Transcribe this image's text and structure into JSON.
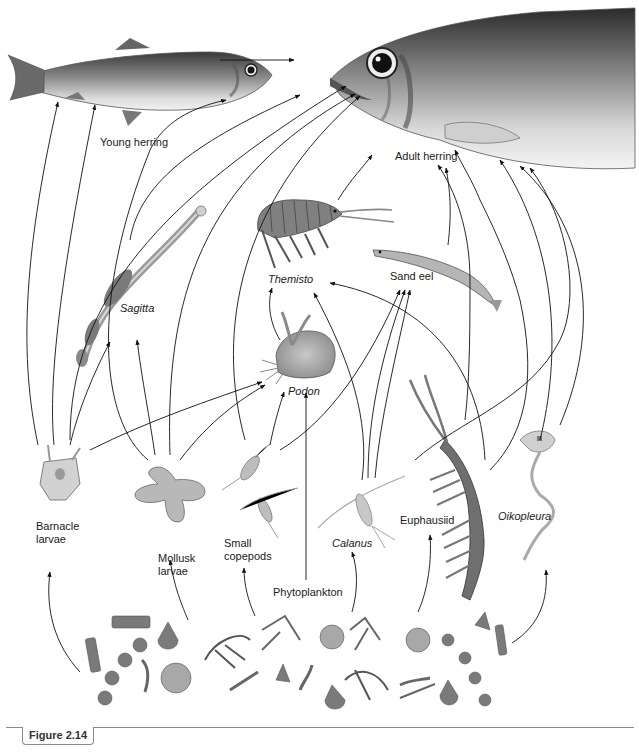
{
  "diagram": {
    "type": "food-web",
    "nodes": {
      "young_herring": {
        "label": "Young herring",
        "italic": false
      },
      "adult_herring": {
        "label": "Adult herring",
        "italic": false
      },
      "sagitta": {
        "label": "Sagitta",
        "italic": true
      },
      "themisto": {
        "label": "Themisto",
        "italic": true
      },
      "sand_eel": {
        "label": "Sand eel",
        "italic": false
      },
      "podon": {
        "label": "Podon",
        "italic": true
      },
      "barnacle_larvae": {
        "label": "Barnacle\nlarvae",
        "italic": false
      },
      "mollusk_larvae": {
        "label": "Mollusk\nlarvae",
        "italic": false
      },
      "small_copepods": {
        "label": "Small\ncopepods",
        "italic": false
      },
      "phytoplankton": {
        "label": "Phytoplankton",
        "italic": false
      },
      "calanus": {
        "label": "Calanus",
        "italic": true
      },
      "euphausiid": {
        "label": "Euphausiid",
        "italic": false
      },
      "oikopleura": {
        "label": "Oikopleura",
        "italic": true
      }
    },
    "edges": [
      [
        "young_herring",
        "adult_herring"
      ],
      [
        "phytoplankton",
        "barnacle_larvae"
      ],
      [
        "phytoplankton",
        "mollusk_larvae"
      ],
      [
        "phytoplankton",
        "small_copepods"
      ],
      [
        "phytoplankton",
        "calanus"
      ],
      [
        "phytoplankton",
        "euphausiid"
      ],
      [
        "phytoplankton",
        "oikopleura"
      ],
      [
        "phytoplankton",
        "podon"
      ],
      [
        "barnacle_larvae",
        "young_herring"
      ],
      [
        "barnacle_larvae",
        "sagitta"
      ],
      [
        "barnacle_larvae",
        "podon"
      ],
      [
        "barnacle_larvae",
        "adult_herring"
      ],
      [
        "mollusk_larvae",
        "sagitta"
      ],
      [
        "mollusk_larvae",
        "young_herring"
      ],
      [
        "mollusk_larvae",
        "adult_herring"
      ],
      [
        "mollusk_larvae",
        "podon"
      ],
      [
        "small_copepods",
        "podon"
      ],
      [
        "small_copepods",
        "sand_eel"
      ],
      [
        "small_copepods",
        "adult_herring"
      ],
      [
        "calanus",
        "themisto"
      ],
      [
        "calanus",
        "sand_eel"
      ],
      [
        "calanus",
        "young_herring"
      ],
      [
        "calanus",
        "adult_herring"
      ],
      [
        "podon",
        "themisto"
      ],
      [
        "euphausiid",
        "themisto"
      ],
      [
        "euphausiid",
        "adult_herring"
      ],
      [
        "oikopleura",
        "adult_herring"
      ],
      [
        "sagitta",
        "adult_herring"
      ],
      [
        "themisto",
        "adult_herring"
      ],
      [
        "sand_eel",
        "adult_herring"
      ]
    ]
  },
  "caption": {
    "figure_label": "Figure 2.14"
  }
}
